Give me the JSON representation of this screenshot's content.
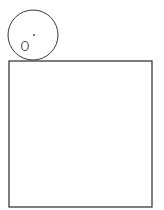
{
  "canvas": {
    "width": 164,
    "height": 210,
    "background": "#ffffff"
  },
  "colors": {
    "stroke": "#3a3a3a"
  },
  "diagram": {
    "circle": {
      "cx": 33,
      "cy": 35,
      "r": 25,
      "stroke_width": 1
    },
    "dot": {
      "cx": 34,
      "cy": 35,
      "r": 0.9
    },
    "ellipse": {
      "cx": 25,
      "cy": 46,
      "rx": 3.3,
      "ry": 4.6,
      "stroke_width": 1
    },
    "square": {
      "x": 9,
      "y": 61,
      "width": 143,
      "height": 146,
      "stroke_width": 1.3
    }
  }
}
